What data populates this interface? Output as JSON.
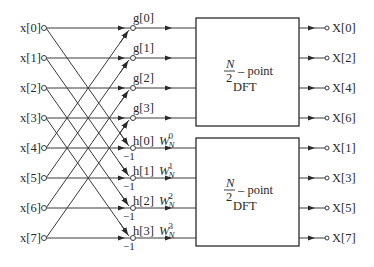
{
  "diagram": {
    "title": "",
    "type": "decimation-in-time FFT flow graph (first stage)",
    "inputs": [
      "x[0]",
      "x[1]",
      "x[2]",
      "x[3]",
      "x[4]",
      "x[5]",
      "x[6]",
      "x[7]"
    ],
    "g_nodes": [
      "g[0]",
      "g[1]",
      "g[2]",
      "g[3]"
    ],
    "h_nodes": [
      "h[0]",
      "h[1]",
      "h[2]",
      "h[3]"
    ],
    "twiddles": [
      {
        "base": "W",
        "sub": "N",
        "sup": "0"
      },
      {
        "base": "W",
        "sub": "N",
        "sup": "1"
      },
      {
        "base": "W",
        "sub": "N",
        "sup": "2"
      },
      {
        "base": "W",
        "sub": "N",
        "sup": "3"
      }
    ],
    "minus_one": "−1",
    "blocks": [
      {
        "numerator": "N",
        "denominator": "2",
        "suffix": "– point",
        "label": "DFT"
      },
      {
        "numerator": "N",
        "denominator": "2",
        "suffix": "– point",
        "label": "DFT"
      }
    ],
    "outputs_top": [
      "X[0]",
      "X[2]",
      "X[4]",
      "X[6]"
    ],
    "outputs_bottom": [
      "X[1]",
      "X[3]",
      "X[5]",
      "X[7]"
    ]
  }
}
